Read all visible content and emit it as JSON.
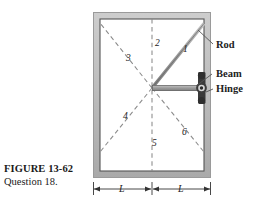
{
  "figure": {
    "caption_title": "FIGURE 13-62",
    "caption_subtitle": "Question 18.",
    "alt": "Beam hinged to a wall supported by a rod, with six numbered candidate rod directions"
  },
  "callouts": {
    "rod": "Rod",
    "beam": "Beam",
    "hinge": "Hinge"
  },
  "numbered_lines": [
    {
      "id": "1",
      "label": "1",
      "style": "solid",
      "description": "rod direction, up and to the right toward top of right wall"
    },
    {
      "id": "2",
      "label": "2",
      "style": "dashed",
      "description": "vertical, straight up"
    },
    {
      "id": "3",
      "label": "3",
      "style": "dashed",
      "description": "up and to the left, toward top-left corner"
    },
    {
      "id": "4",
      "label": "4",
      "style": "dashed",
      "description": "down and to the left, toward bottom-left corner"
    },
    {
      "id": "5",
      "label": "5",
      "style": "dashed",
      "description": "vertical, straight down"
    },
    {
      "id": "6",
      "label": "6",
      "style": "dashed",
      "description": "down and to the right, toward bottom-right corner"
    }
  ],
  "dimensions": {
    "left_span": "L",
    "right_span": "L"
  },
  "colors": {
    "wall_fill": "#b9b9b9",
    "wall_edge": "#6f6f6f",
    "interior": "#ffffff",
    "dashed_line": "#8a8a8a",
    "rod": "#8d8d8d",
    "rod_edge": "#5a5a5a",
    "beam": "#9a9a9a",
    "hinge": "#3a3a3a",
    "text": "#222222",
    "leader": "#555555"
  }
}
